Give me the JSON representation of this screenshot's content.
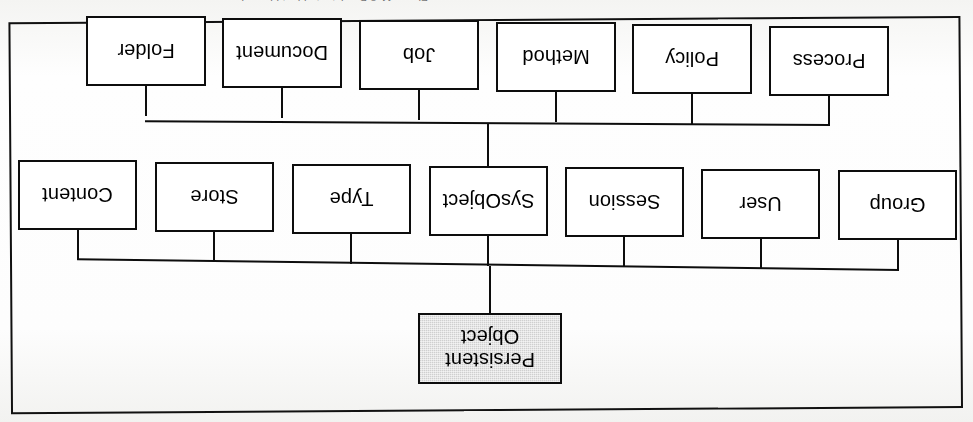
{
  "figure": {
    "caption": "Figure 11-3   Persistent object hierarchy",
    "orientation": "rotated-180",
    "root": {
      "label": "Persistent Object",
      "line1": "Persistent",
      "line2": "Object",
      "shaded": true,
      "fill": "#cfcfcf"
    },
    "border_color": "#0d0d0d",
    "background_color": "#ffffff"
  },
  "levels": {
    "level1": {
      "name": "SysObject subclasses",
      "nodes": [
        {
          "label": "Process"
        },
        {
          "label": "Policy"
        },
        {
          "label": "Method"
        },
        {
          "label": "Job"
        },
        {
          "label": "Document"
        },
        {
          "label": "Folder"
        }
      ]
    },
    "level2": {
      "name": "Persistent Object subclasses",
      "nodes": [
        {
          "label": "Group"
        },
        {
          "label": "User"
        },
        {
          "label": "Session"
        },
        {
          "label": "SysObject"
        },
        {
          "label": "Type"
        },
        {
          "label": "Store"
        },
        {
          "label": "Content"
        }
      ]
    }
  }
}
